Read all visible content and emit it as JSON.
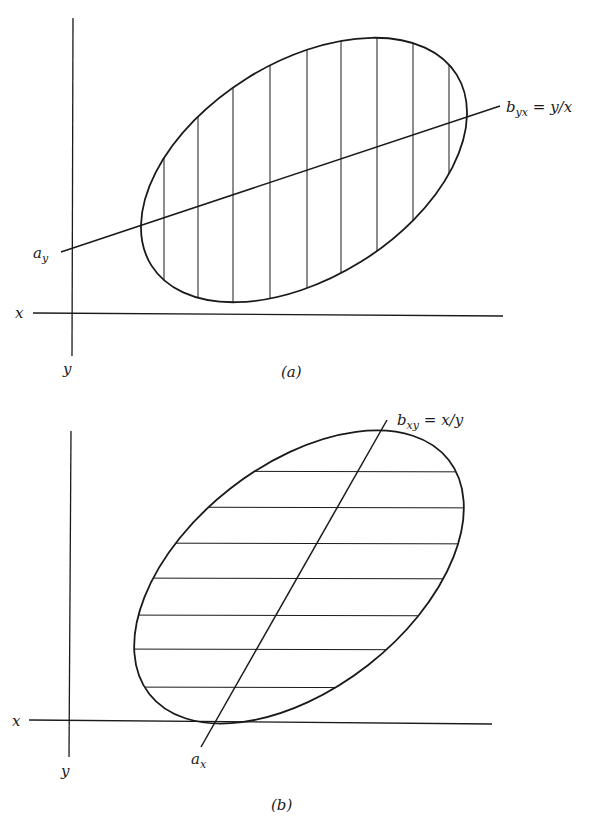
{
  "panels": [
    {
      "id": "a",
      "caption": "(a)",
      "axes": {
        "x_label": "x",
        "y_label": "y"
      },
      "intercept_label": {
        "main": "a",
        "sub": "y"
      },
      "regression_label": {
        "main": "b",
        "sub": "yx",
        "rest": " = y/x"
      },
      "hatching": "vertical",
      "hatch_count": 9
    },
    {
      "id": "b",
      "caption": "(b)",
      "axes": {
        "x_label": "x",
        "y_label": "y"
      },
      "intercept_label": {
        "main": "a",
        "sub": "x"
      },
      "regression_label": {
        "main": "b",
        "sub": "xy",
        "rest": " = x/y"
      },
      "hatching": "horizontal",
      "hatch_count": 7
    }
  ],
  "colors": {
    "ink": "#1a1a1a",
    "background": "#ffffff"
  }
}
